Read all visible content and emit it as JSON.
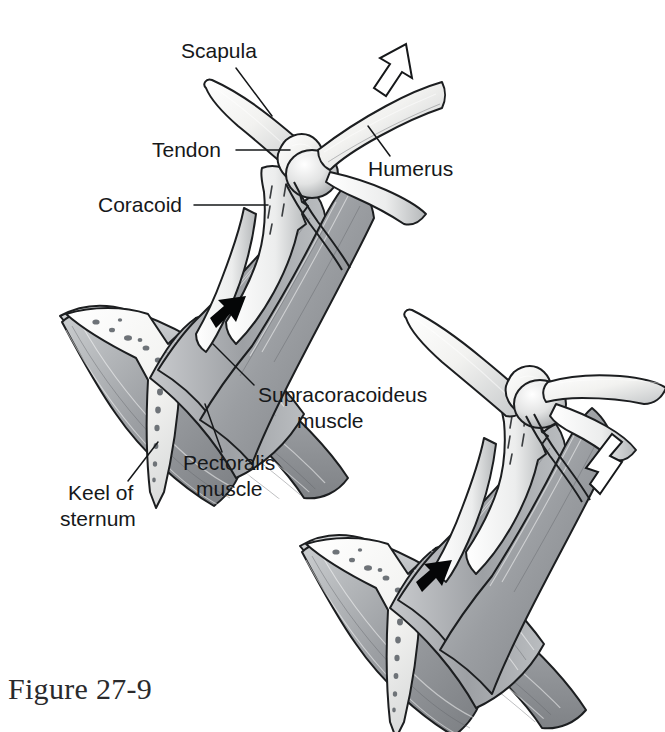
{
  "figure": {
    "caption": "Figure 27-9"
  },
  "labels": {
    "scapula": "Scapula",
    "tendon": "Tendon",
    "coracoid": "Coracoid",
    "humerus": "Humerus",
    "supracoracoideus_line1": "Supracoracoideus",
    "supracoracoideus_line2": "muscle",
    "pectoralis_line1": "Pectoralis",
    "pectoralis_line2": "muscle",
    "keel_line1": "Keel of",
    "keel_line2": "sternum"
  },
  "panels": [
    {
      "id": "upstroke",
      "name": "upper-figure-upstroke",
      "wing_arrow": "hollow-arrow-up-right",
      "muscle_arrow": "solid-arrow-down-left"
    },
    {
      "id": "downstroke",
      "name": "lower-figure-downstroke",
      "wing_arrow": "hollow-arrow-down-right",
      "muscle_arrow": "solid-arrow-down-left"
    }
  ],
  "colors": {
    "ink": "#16181a",
    "bone_light": "#fbfbfa",
    "bone_shade": "#b9bcbe",
    "muscle_light": "#c9cbcd",
    "muscle_mid": "#9a9da1",
    "muscle_dark": "#74777b",
    "background": "#ffffff"
  }
}
